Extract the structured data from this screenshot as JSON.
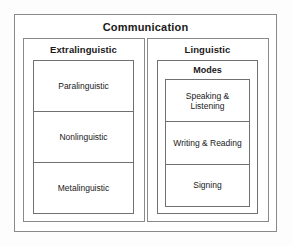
{
  "diagram": {
    "type": "nested-hierarchy",
    "title": "Communication",
    "panels": [
      {
        "id": "extralinguistic",
        "title": "Extralinguistic",
        "cells": [
          {
            "label": "Paralinguistic"
          },
          {
            "label": "Nonlinguistic"
          },
          {
            "label": "Metalinguistic"
          }
        ]
      },
      {
        "id": "linguistic",
        "title": "Linguistic",
        "subgroup": {
          "id": "modes",
          "title": "Modes",
          "cells": [
            {
              "label": "Speaking & Listening"
            },
            {
              "label": "Writing & Reading"
            },
            {
              "label": "Signing"
            }
          ]
        }
      }
    ]
  },
  "colors": {
    "outer_border": "#8a8a8a",
    "inner_border": "#707070",
    "background": "#ffffff",
    "text": "#1a1a1a"
  }
}
